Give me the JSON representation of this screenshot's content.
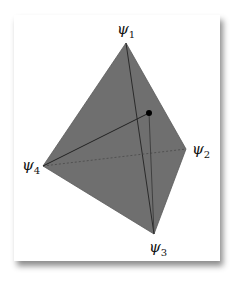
{
  "diagram": {
    "title": "",
    "fill_color": "#6f6f6f",
    "edge_color": "#222222",
    "vertices": [
      {
        "id": "psi1",
        "symbol": "ψ",
        "index": "1",
        "x": 126,
        "y": 43
      },
      {
        "id": "psi2",
        "symbol": "ψ",
        "index": "2",
        "x": 186,
        "y": 149
      },
      {
        "id": "psi3",
        "symbol": "ψ",
        "index": "3",
        "x": 154,
        "y": 234
      },
      {
        "id": "psi4",
        "symbol": "ψ",
        "index": "4",
        "x": 43,
        "y": 166
      }
    ],
    "point": {
      "x": 149,
      "y": 113
    }
  }
}
